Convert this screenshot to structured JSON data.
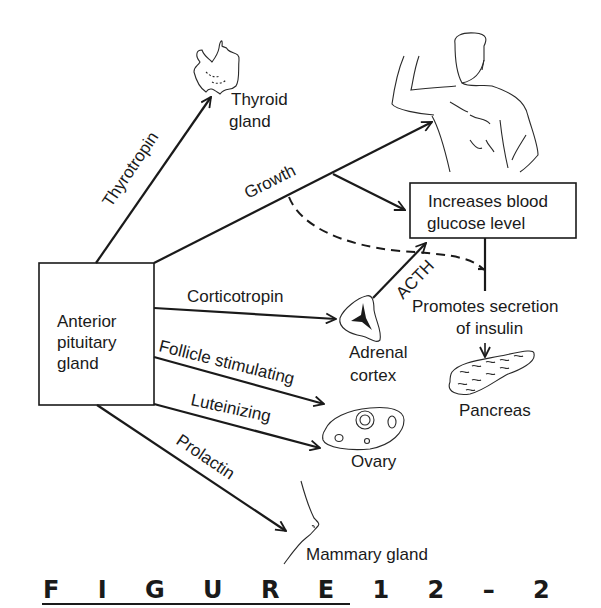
{
  "figure": {
    "caption": "F I G U R E   1 2 – 2",
    "caption_parts": [
      "FIGURE",
      "12–2"
    ]
  },
  "source": {
    "label_line1": "Anterior",
    "label_line2": "pituitary",
    "label_line3": "gland"
  },
  "hormones": {
    "thyrotropin": "Thyrotropin",
    "growth": "Growth",
    "corticotropin": "Corticotropin",
    "follicle_stimulating": "Follicle stimulating",
    "luteinizing": "Luteinizing",
    "prolactin": "Prolactin",
    "acth": "ACTH"
  },
  "targets": {
    "thyroid_line1": "Thyroid",
    "thyroid_line2": "gland",
    "adrenal_line1": "Adrenal",
    "adrenal_line2": "cortex",
    "ovary": "Ovary",
    "mammary": "Mammary gland",
    "pancreas": "Pancreas"
  },
  "effects": {
    "glucose_line1": "Increases blood",
    "glucose_line2": "glucose level",
    "insulin_line1": "Promotes secretion",
    "insulin_line2": "of insulin"
  }
}
